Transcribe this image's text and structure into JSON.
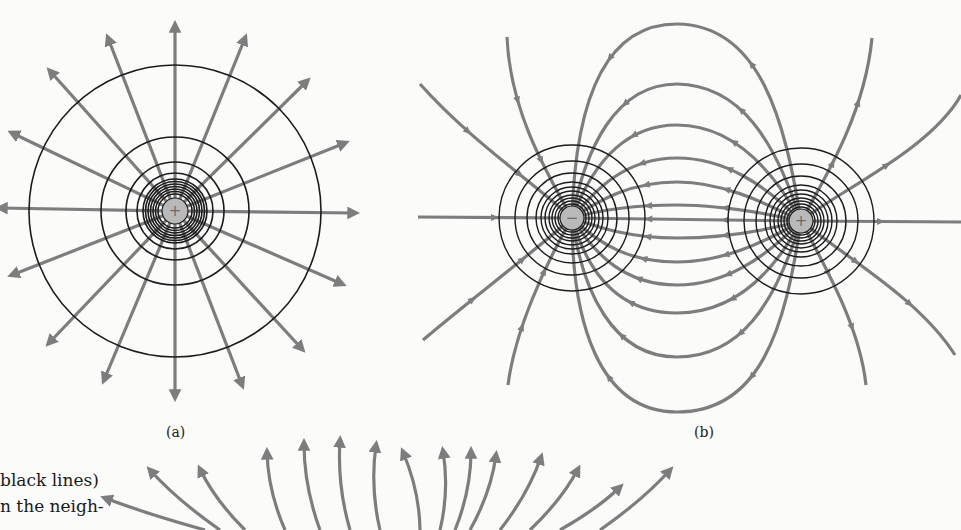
{
  "colors": {
    "field_line": "#7d7d7d",
    "equipotential": "#1c1c1c",
    "charge_fill": "#b9b9b9",
    "charge_sign": "#6b6b6b",
    "background": "#fbfbfa"
  },
  "panel_a": {
    "caption": "(a)",
    "charge": {
      "x": 175,
      "y": 211,
      "r": 13,
      "sign": "+"
    },
    "equipotential_radii": [
      17,
      19.5,
      22,
      24.5,
      27,
      29.5,
      32,
      38,
      49,
      74,
      146
    ],
    "field_line_count": 16,
    "field_line_start_r": 13,
    "field_line_end_points": [
      [
        355,
        213
      ],
      [
        342,
        284
      ],
      [
        302,
        349
      ],
      [
        242,
        385
      ],
      [
        175,
        397
      ],
      [
        104,
        380
      ],
      [
        49,
        343
      ],
      [
        12,
        275
      ],
      [
        0,
        208
      ],
      [
        12,
        133
      ],
      [
        50,
        71
      ],
      [
        108,
        38
      ],
      [
        175,
        25
      ],
      [
        245,
        38
      ],
      [
        307,
        81
      ],
      [
        345,
        143
      ]
    ]
  },
  "panel_b": {
    "caption": "(b)",
    "negative_charge": {
      "x": 572,
      "y": 218,
      "r": 12,
      "sign": "−"
    },
    "positive_charge": {
      "x": 801,
      "y": 221,
      "r": 12,
      "sign": "+"
    },
    "equipotential_radii": [
      14,
      17,
      20,
      23,
      27,
      31,
      36,
      45,
      57,
      73
    ],
    "field_lines": [
      {
        "d": "M 801 221 C 785 120, 760 25, 677 24 C 600 24, 575 110, 572 218",
        "arrows": [
          [
            741,
            60
          ],
          [
            608,
            58
          ]
        ]
      },
      {
        "d": "M 801 221 C 775 140, 740 85, 677 84 C 615 84, 585 150, 572 218",
        "arrows": [
          [
            720,
            104
          ],
          [
            632,
            98
          ]
        ]
      },
      {
        "d": "M 801 221 C 770 165, 730 125, 677 125 C 620 125, 590 170, 572 218",
        "arrows": [
          [
            713,
            137
          ],
          [
            640,
            133
          ]
        ]
      },
      {
        "d": "M 801 221 C 765 185, 725 158, 677 158 C 625 158, 595 190, 572 218",
        "arrows": [
          [
            700,
            164
          ],
          [
            648,
            163
          ]
        ]
      },
      {
        "d": "M 801 221 C 760 200, 720 182, 677 182 C 630 182, 600 200, 572 218",
        "arrows": [
          [
            700,
            184
          ],
          [
            655,
            184
          ]
        ]
      },
      {
        "d": "M 801 221 C 760 212, 720 205, 677 205 C 630 205, 600 210, 572 218",
        "arrows": [
          [
            700,
            206
          ],
          [
            655,
            206
          ]
        ]
      },
      {
        "d": "M 801 221 L 572 218",
        "arrows": [
          [
            700,
            220
          ],
          [
            655,
            219
          ]
        ]
      },
      {
        "d": "M 801 221 C 760 232, 720 238, 677 238 C 630 238, 600 228, 572 218",
        "arrows": [
          [
            700,
            238
          ],
          [
            655,
            238
          ]
        ]
      },
      {
        "d": "M 801 221 C 760 245, 720 262, 677 262 C 630 262, 600 245, 572 218",
        "arrows": [
          [
            700,
            260
          ],
          [
            655,
            261
          ]
        ]
      },
      {
        "d": "M 801 221 C 765 258, 725 285, 677 285 C 625 285, 595 255, 572 218",
        "arrows": [
          [
            705,
            283
          ],
          [
            648,
            282
          ]
        ]
      },
      {
        "d": "M 801 221 C 770 280, 730 313, 677 313 C 620 313, 588 275, 572 218",
        "arrows": [
          [
            717,
            305
          ],
          [
            638,
            307
          ]
        ]
      },
      {
        "d": "M 801 221 C 775 305, 740 357, 677 357 C 612 357, 582 290, 572 218",
        "arrows": [
          [
            738,
            340
          ],
          [
            627,
            345
          ]
        ]
      },
      {
        "d": "M 801 221 C 785 330, 760 412, 677 412 C 598 412, 572 320, 572 218",
        "arrows": [
          [
            756,
            384
          ],
          [
            598,
            372
          ]
        ]
      },
      {
        "d": "M 572 218 L 418 217",
        "arrows": [
          [
            460,
            217
          ]
        ],
        "dir": "in"
      },
      {
        "d": "M 572 218 C 530 180, 470 140, 420 84",
        "arrows": [
          [
            458,
            135
          ],
          [
            517,
            168
          ]
        ],
        "dir": "in"
      },
      {
        "d": "M 572 218 C 545 170, 510 110, 507 37",
        "arrows": [
          [
            523,
            95
          ],
          [
            545,
            155
          ]
        ],
        "dir": "in"
      },
      {
        "d": "M 572 218 C 530 255, 470 300, 423 340",
        "arrows": [
          [
            462,
            310
          ],
          [
            515,
            265
          ]
        ],
        "dir": "in"
      },
      {
        "d": "M 572 218 C 545 265, 515 330, 508 385",
        "arrows": [
          [
            518,
            342
          ],
          [
            540,
            285
          ]
        ],
        "dir": "in"
      },
      {
        "d": "M 801 221 L 961 222",
        "arrows": [
          [
            880,
            222
          ]
        ]
      },
      {
        "d": "M 801 221 C 840 190, 930 150, 961 95",
        "arrows": [
          [
            870,
            190
          ]
        ]
      },
      {
        "d": "M 801 221 C 830 170, 865 110, 872 38",
        "arrows": [
          [
            842,
            160
          ],
          [
            873,
            38
          ]
        ]
      },
      {
        "d": "M 801 221 C 850 260, 920 300, 955 355",
        "arrows": [
          [
            865,
            262
          ],
          [
            955,
            355
          ]
        ]
      },
      {
        "d": "M 801 221 C 830 275, 860 330, 866 385",
        "arrows": [
          [
            838,
            290
          ],
          [
            866,
            385
          ]
        ]
      }
    ]
  },
  "panel_c_partial": {
    "fan_arrows": [
      {
        "d": "M 112 530 L 112 530"
      },
      {
        "d": "M 120 530 C 115 515, 112 507, 110 500"
      },
      {
        "d": "M 150 530 C 130 512, 115 500, 100 490"
      },
      {
        "d": "M 200 530 C 180 500, 160 490, 130 473"
      },
      {
        "d": "M 240 530 C 225 500, 200 480, 173 461"
      },
      {
        "d": "M 285 530 C 268 495, 255 478, 240 463"
      },
      {
        "d": "M 330 530 C 318 500, 300 475, 286 453"
      },
      {
        "d": "M 370 530 C 360 495, 348 470, 338 455"
      },
      {
        "d": "M 405 530 C 400 500, 395 475, 390 453"
      },
      {
        "d": "M 430 530 C 432 500, 442 470, 446 453"
      },
      {
        "d": "M 455 530 C 462 500, 470 470, 478 450"
      },
      {
        "d": "M 480 530 C 492 500, 510 475, 527 458"
      },
      {
        "d": "M 505 530 C 518 505, 540 485, 562 470"
      },
      {
        "d": "M 535 530 C 560 505, 600 490, 670 470"
      }
    ],
    "visible_tips": [
      [
        110,
        496
      ],
      [
        200,
        469
      ],
      [
        266,
        453
      ],
      [
        302,
        443
      ],
      [
        340,
        442
      ],
      [
        376,
        446
      ],
      [
        445,
        451
      ],
      [
        471,
        451
      ],
      [
        497,
        453
      ],
      [
        540,
        457
      ],
      [
        577,
        469
      ],
      [
        618,
        486
      ],
      [
        670,
        470
      ],
      [
        220,
        470
      ],
      [
        150,
        470
      ]
    ]
  },
  "body_text": {
    "line1": "black lines)",
    "line2": "n the neigh-"
  }
}
